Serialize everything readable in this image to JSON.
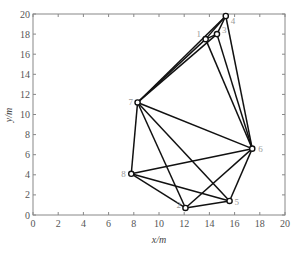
{
  "chart_data": {
    "type": "scatter",
    "title": "",
    "xlabel": "x/m",
    "ylabel": "y/m",
    "xlim": [
      0,
      20
    ],
    "ylim": [
      0,
      20
    ],
    "xticks": [
      0,
      2,
      4,
      6,
      8,
      10,
      12,
      14,
      16,
      18,
      20
    ],
    "yticks": [
      0,
      2,
      4,
      6,
      8,
      10,
      12,
      14,
      16,
      18,
      20
    ],
    "grid": false,
    "legend": null,
    "nodes": [
      {
        "id": "1",
        "x": 13.7,
        "y": 17.5
      },
      {
        "id": "2",
        "x": 12.1,
        "y": 0.7
      },
      {
        "id": "3",
        "x": 14.6,
        "y": 18.0
      },
      {
        "id": "4",
        "x": 15.3,
        "y": 19.8
      },
      {
        "id": "5",
        "x": 15.6,
        "y": 1.4
      },
      {
        "id": "6",
        "x": 17.4,
        "y": 6.6
      },
      {
        "id": "7",
        "x": 8.3,
        "y": 11.2
      },
      {
        "id": "8",
        "x": 7.8,
        "y": 4.1
      }
    ],
    "edges": [
      [
        "7",
        "4"
      ],
      [
        "7",
        "1"
      ],
      [
        "7",
        "3"
      ],
      [
        "1",
        "3"
      ],
      [
        "3",
        "4"
      ],
      [
        "1",
        "4"
      ],
      [
        "1",
        "6"
      ],
      [
        "3",
        "6"
      ],
      [
        "4",
        "6"
      ],
      [
        "7",
        "6"
      ],
      [
        "7",
        "8"
      ],
      [
        "7",
        "2"
      ],
      [
        "7",
        "5"
      ],
      [
        "8",
        "6"
      ],
      [
        "8",
        "2"
      ],
      [
        "8",
        "5"
      ],
      [
        "2",
        "5"
      ],
      [
        "2",
        "6"
      ],
      [
        "5",
        "6"
      ]
    ]
  }
}
